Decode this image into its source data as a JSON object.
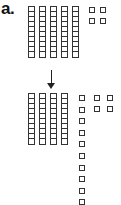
{
  "label": "a.",
  "top": {
    "tens_rods": 5,
    "rod_cells": 10,
    "ones": 4,
    "value": 54
  },
  "arrow": "down-arrow",
  "bottom": {
    "tens_rods": 4,
    "rod_cells": 10,
    "ones": 14,
    "value": 54
  },
  "colors": {
    "stroke": "#333333",
    "background": "#ffffff"
  }
}
